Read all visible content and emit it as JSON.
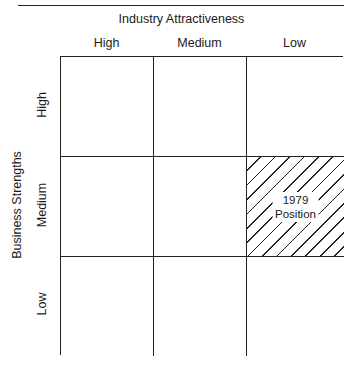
{
  "title": "Industry Attractiveness",
  "columns": [
    "High",
    "Medium",
    "Low"
  ],
  "y_axis_label": "Business Strengths",
  "rows": [
    "High",
    "Medium",
    "Low"
  ],
  "highlight": {
    "row": "Medium",
    "column": "Low",
    "label_line1": "1979",
    "label_line2": "Position",
    "pattern": "diagonal-hatch"
  }
}
